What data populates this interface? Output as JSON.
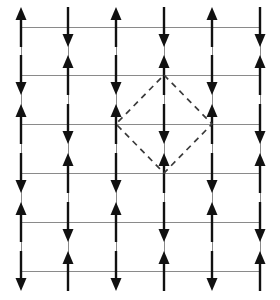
{
  "figure": {
    "background_color": "#ffffff",
    "grid_color": "#8a8a8a",
    "arrow_color": "#111111",
    "plaquette_color": "#3a3a3a"
  },
  "lattice": {
    "rows": 6,
    "cols": 6,
    "column_x": [
      21,
      68,
      116,
      164,
      212,
      260
    ],
    "row_y": [
      27,
      75,
      124,
      173,
      222,
      271
    ],
    "arrow_length": 40,
    "arrow_head_width": 11,
    "arrow_head_length": 13,
    "pattern": "checkerboard-alternating",
    "spins": [
      [
        "up",
        "down",
        "up",
        "down",
        "up",
        "down"
      ],
      [
        "down",
        "up",
        "down",
        "up",
        "down",
        "up"
      ],
      [
        "up",
        "down",
        "up",
        "down",
        "up",
        "down"
      ],
      [
        "down",
        "up",
        "down",
        "up",
        "down",
        "up"
      ],
      [
        "up",
        "down",
        "up",
        "down",
        "up",
        "down"
      ],
      [
        "down",
        "up",
        "down",
        "up",
        "down",
        "up"
      ]
    ]
  },
  "plaquette": {
    "shape": "diamond",
    "stroke_style": "dashed",
    "vertices": [
      {
        "label": "top",
        "row": 1,
        "col": 3,
        "x": 164,
        "y": 75
      },
      {
        "label": "right",
        "row": 2,
        "col": 4,
        "x": 212,
        "y": 124
      },
      {
        "label": "bottom",
        "row": 3,
        "col": 3,
        "x": 164,
        "y": 173
      },
      {
        "label": "left",
        "row": 2,
        "col": 2,
        "x": 116,
        "y": 124
      }
    ]
  }
}
